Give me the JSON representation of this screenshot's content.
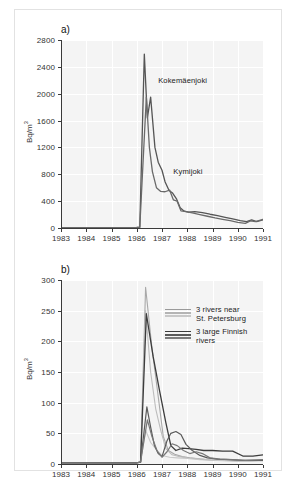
{
  "figure": {
    "background": "#ffffff",
    "frame_color": "#e2e2e2",
    "plot_background": "#f4f4f4",
    "grid_color": "#ffffff",
    "axis_color": "#3a3a3a"
  },
  "chart_data": [
    {
      "id": "panel-a",
      "type": "line",
      "panel_tag": "a)",
      "title": "",
      "xlabel": "",
      "ylabel": "Bq/m3",
      "ylabel_display": "Bq/m",
      "ylabel_sup": "3",
      "xlim": [
        1983,
        1991
      ],
      "ylim": [
        0,
        2800
      ],
      "yticks": [
        0,
        400,
        800,
        1200,
        1600,
        2000,
        2400,
        2800
      ],
      "ytick_labels": [
        "0",
        "400",
        "800",
        "1200",
        "1600",
        "2000",
        "2400",
        "2800"
      ],
      "xticks": [
        1983,
        1984,
        1985,
        1986,
        1987,
        1988,
        1989,
        1990,
        1991
      ],
      "xtick_labels": [
        "1983",
        "1984",
        "1985",
        "1986",
        "1987",
        "1988",
        "1989",
        "1990",
        "1991"
      ],
      "grid": true,
      "legend_position": "inline-annotations",
      "annotations": [
        {
          "text": "Kokemäenjoki",
          "x": 1986.85,
          "y": 2270
        },
        {
          "text": "Kymijoki",
          "x": 1987.45,
          "y": 915
        }
      ],
      "series": [
        {
          "name": "Kokemäenjoki",
          "color": "#555555",
          "width": 1.3,
          "points": [
            [
              1983.0,
              6
            ],
            [
              1983.5,
              6
            ],
            [
              1984.0,
              6
            ],
            [
              1984.5,
              6
            ],
            [
              1985.0,
              6
            ],
            [
              1985.5,
              6
            ],
            [
              1986.0,
              8
            ],
            [
              1986.12,
              10
            ],
            [
              1986.3,
              2590
            ],
            [
              1986.42,
              1640
            ],
            [
              1986.55,
              1950
            ],
            [
              1986.72,
              1200
            ],
            [
              1986.85,
              980
            ],
            [
              1987.0,
              860
            ],
            [
              1987.12,
              690
            ],
            [
              1987.28,
              560
            ],
            [
              1987.42,
              520
            ],
            [
              1987.58,
              430
            ],
            [
              1987.72,
              300
            ],
            [
              1987.88,
              250
            ],
            [
              1988.05,
              235
            ],
            [
              1988.3,
              245
            ],
            [
              1988.6,
              230
            ],
            [
              1988.9,
              205
            ],
            [
              1989.2,
              185
            ],
            [
              1989.5,
              160
            ],
            [
              1989.8,
              135
            ],
            [
              1990.1,
              110
            ],
            [
              1990.35,
              95
            ],
            [
              1990.55,
              120
            ],
            [
              1990.75,
              95
            ],
            [
              1991.0,
              120
            ]
          ]
        },
        {
          "name": "Kymijoki",
          "color": "#6a6a6a",
          "width": 1.3,
          "points": [
            [
              1983.0,
              6
            ],
            [
              1983.5,
              6
            ],
            [
              1984.0,
              6
            ],
            [
              1984.5,
              6
            ],
            [
              1985.0,
              6
            ],
            [
              1985.5,
              6
            ],
            [
              1986.0,
              8
            ],
            [
              1986.12,
              10
            ],
            [
              1986.38,
              1950
            ],
            [
              1986.5,
              1200
            ],
            [
              1986.62,
              840
            ],
            [
              1986.78,
              600
            ],
            [
              1986.95,
              545
            ],
            [
              1987.12,
              540
            ],
            [
              1987.3,
              565
            ],
            [
              1987.45,
              420
            ],
            [
              1987.6,
              400
            ],
            [
              1987.75,
              255
            ],
            [
              1987.95,
              245
            ],
            [
              1988.2,
              225
            ],
            [
              1988.5,
              200
            ],
            [
              1988.8,
              175
            ],
            [
              1989.1,
              150
            ],
            [
              1989.4,
              130
            ],
            [
              1989.7,
              110
            ],
            [
              1990.0,
              85
            ],
            [
              1990.3,
              70
            ],
            [
              1990.5,
              105
            ],
            [
              1990.7,
              95
            ],
            [
              1991.0,
              130
            ]
          ]
        }
      ]
    },
    {
      "id": "panel-b",
      "type": "line",
      "panel_tag": "b)",
      "title": "",
      "xlabel": "",
      "ylabel": "Bq/m3",
      "ylabel_display": "Bq/m",
      "ylabel_sup": "3",
      "xlim": [
        1983,
        1991
      ],
      "ylim": [
        0,
        300
      ],
      "yticks": [
        0,
        50,
        100,
        150,
        200,
        250,
        300
      ],
      "ytick_labels": [
        "0",
        "50",
        "100",
        "150",
        "200",
        "250",
        "300"
      ],
      "xticks": [
        1983,
        1984,
        1985,
        1986,
        1987,
        1988,
        1989,
        1990,
        1991
      ],
      "xtick_labels": [
        "1983",
        "1984",
        "1985",
        "1986",
        "1987",
        "1988",
        "1989",
        "1990",
        "1991"
      ],
      "grid": true,
      "legend_position": "upper-right-inside",
      "legend_groups": [
        {
          "label_lines": [
            "3 rivers near",
            "St. Petersburg"
          ],
          "colors": [
            "#9a9a9a",
            "#b4b4b4",
            "#c8c8c8"
          ]
        },
        {
          "label_lines": [
            "3 large Finnish",
            "rivers"
          ],
          "colors": [
            "#3c3c3c",
            "#5a5a5a",
            "#7a7a7a"
          ]
        }
      ],
      "series": [
        {
          "name": "St. Petersburg river 1",
          "group": "3 rivers near St. Petersburg",
          "color": "#a8a8a8",
          "width": 1.1,
          "points": [
            [
              1983.0,
              2
            ],
            [
              1984.0,
              2
            ],
            [
              1985.0,
              2
            ],
            [
              1986.0,
              2
            ],
            [
              1986.15,
              3
            ],
            [
              1986.35,
              288
            ],
            [
              1986.6,
              190
            ],
            [
              1986.85,
              110
            ],
            [
              1987.05,
              45
            ],
            [
              1987.25,
              22
            ],
            [
              1987.5,
              16
            ],
            [
              1987.8,
              12
            ],
            [
              1988.1,
              10
            ],
            [
              1988.5,
              8
            ],
            [
              1989.0,
              6
            ],
            [
              1989.5,
              6
            ],
            [
              1990.0,
              5
            ],
            [
              1990.5,
              5
            ],
            [
              1991.0,
              6
            ]
          ]
        },
        {
          "name": "St. Petersburg river 2",
          "group": "3 rivers near St. Petersburg",
          "color": "#bcbcbc",
          "width": 1.1,
          "points": [
            [
              1983.0,
              2
            ],
            [
              1984.0,
              2
            ],
            [
              1985.0,
              2
            ],
            [
              1986.0,
              2
            ],
            [
              1986.15,
              3
            ],
            [
              1986.35,
              250
            ],
            [
              1986.55,
              150
            ],
            [
              1986.75,
              90
            ],
            [
              1986.95,
              55
            ],
            [
              1987.15,
              25
            ],
            [
              1987.4,
              15
            ],
            [
              1987.7,
              12
            ],
            [
              1988.0,
              10
            ],
            [
              1988.4,
              9
            ],
            [
              1988.9,
              7
            ],
            [
              1989.4,
              6
            ],
            [
              1989.9,
              5
            ],
            [
              1990.4,
              5
            ],
            [
              1991.0,
              6
            ]
          ]
        },
        {
          "name": "St. Petersburg river 3",
          "group": "3 rivers near St. Petersburg",
          "color": "#c9c9c9",
          "width": 1.1,
          "points": [
            [
              1983.0,
              2
            ],
            [
              1984.0,
              2
            ],
            [
              1985.0,
              2
            ],
            [
              1986.0,
              2
            ],
            [
              1986.15,
              3
            ],
            [
              1986.35,
              55
            ],
            [
              1986.55,
              35
            ],
            [
              1986.8,
              22
            ],
            [
              1987.0,
              14
            ],
            [
              1987.3,
              11
            ],
            [
              1987.6,
              10
            ],
            [
              1988.0,
              9
            ],
            [
              1988.5,
              7
            ],
            [
              1989.0,
              6
            ],
            [
              1989.6,
              5
            ],
            [
              1990.2,
              5
            ],
            [
              1991.0,
              5
            ]
          ]
        },
        {
          "name": "Finnish river 1",
          "group": "3 large Finnish rivers",
          "color": "#3c3c3c",
          "width": 1.3,
          "points": [
            [
              1983.0,
              2
            ],
            [
              1984.0,
              2
            ],
            [
              1985.0,
              2
            ],
            [
              1986.0,
              2
            ],
            [
              1986.15,
              3
            ],
            [
              1986.38,
              245
            ],
            [
              1986.65,
              175
            ],
            [
              1986.9,
              120
            ],
            [
              1987.15,
              68
            ],
            [
              1987.35,
              30
            ],
            [
              1987.55,
              22
            ],
            [
              1987.8,
              26
            ],
            [
              1988.05,
              25
            ],
            [
              1988.35,
              24
            ],
            [
              1988.65,
              22
            ],
            [
              1989.0,
              22
            ],
            [
              1989.4,
              21
            ],
            [
              1989.8,
              21
            ],
            [
              1990.2,
              13
            ],
            [
              1990.6,
              13
            ],
            [
              1991.0,
              15
            ]
          ]
        },
        {
          "name": "Finnish river 2",
          "group": "3 large Finnish rivers",
          "color": "#5a5a5a",
          "width": 1.2,
          "points": [
            [
              1983.0,
              2
            ],
            [
              1984.0,
              2
            ],
            [
              1985.0,
              2
            ],
            [
              1986.0,
              2
            ],
            [
              1986.15,
              3
            ],
            [
              1986.4,
              93
            ],
            [
              1986.55,
              60
            ],
            [
              1986.7,
              30
            ],
            [
              1986.85,
              17
            ],
            [
              1987.0,
              12
            ],
            [
              1987.2,
              38
            ],
            [
              1987.35,
              50
            ],
            [
              1987.55,
              53
            ],
            [
              1987.75,
              48
            ],
            [
              1987.95,
              32
            ],
            [
              1988.2,
              22
            ],
            [
              1988.5,
              14
            ],
            [
              1988.8,
              10
            ],
            [
              1989.2,
              8
            ],
            [
              1989.7,
              7
            ],
            [
              1990.2,
              6
            ],
            [
              1991.0,
              6
            ]
          ]
        },
        {
          "name": "Finnish river 3",
          "group": "3 large Finnish rivers",
          "color": "#787878",
          "width": 1.2,
          "points": [
            [
              1983.0,
              2
            ],
            [
              1984.0,
              2
            ],
            [
              1985.0,
              2
            ],
            [
              1986.0,
              2
            ],
            [
              1986.15,
              3
            ],
            [
              1986.42,
              72
            ],
            [
              1986.6,
              45
            ],
            [
              1986.8,
              22
            ],
            [
              1987.0,
              11
            ],
            [
              1987.2,
              20
            ],
            [
              1987.4,
              33
            ],
            [
              1987.6,
              30
            ],
            [
              1987.85,
              22
            ],
            [
              1988.1,
              17
            ],
            [
              1988.35,
              20
            ],
            [
              1988.6,
              17
            ],
            [
              1988.9,
              10
            ],
            [
              1989.3,
              8
            ],
            [
              1989.8,
              7
            ],
            [
              1990.3,
              6
            ],
            [
              1991.0,
              7
            ]
          ]
        }
      ]
    }
  ]
}
